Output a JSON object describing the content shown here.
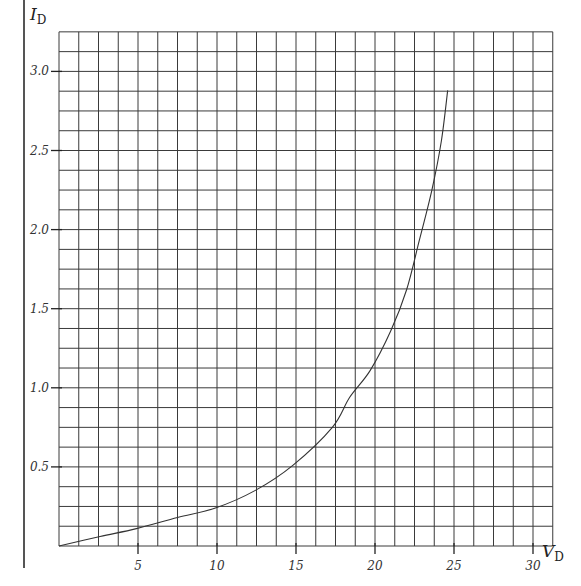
{
  "chart_data": {
    "type": "line",
    "title": "",
    "xlabel": "V_D",
    "ylabel": "I_D",
    "xlabel_main": "V",
    "xlabel_sub": "D",
    "ylabel_main": "I",
    "ylabel_sub": "D",
    "xlim": [
      0,
      31.25
    ],
    "ylim": [
      0,
      3.25
    ],
    "grid": true,
    "grid_x_step": 1.25,
    "grid_y_step": 0.125,
    "x_ticks": [
      5,
      10,
      15,
      20,
      25,
      30
    ],
    "x_tick_labels": [
      "5",
      "10",
      "15",
      "20",
      "25",
      "30"
    ],
    "y_ticks": [
      0.5,
      1.0,
      1.5,
      2.0,
      2.5,
      3.0
    ],
    "y_tick_labels": [
      "0.5",
      "1.0",
      "1.5",
      "2.0",
      "2.5",
      "3.0"
    ],
    "legend": null,
    "series": [
      {
        "name": "I-V curve",
        "x": [
          0,
          2.6,
          4.9,
          7.5,
          9.9,
          12.4,
          14.8,
          17.3,
          18.4,
          19.7,
          21.0,
          22.0,
          22.8,
          23.6,
          24.2,
          24.6
        ],
        "y": [
          0,
          0.06,
          0.11,
          0.18,
          0.24,
          0.35,
          0.51,
          0.75,
          0.94,
          1.11,
          1.36,
          1.62,
          1.93,
          2.25,
          2.56,
          2.88
        ]
      }
    ]
  },
  "colors": {
    "grid": "#3a3a3a",
    "curve": "#333333",
    "left_bar": "#555555",
    "background": "#ffffff"
  }
}
